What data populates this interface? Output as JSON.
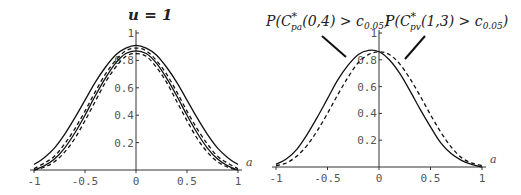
{
  "chart_data": [
    {
      "type": "line",
      "title": "u = 1",
      "xlabel": "a",
      "ylabel": "",
      "xlim": [
        -1,
        1
      ],
      "ylim": [
        0,
        1
      ],
      "x_ticks": [
        "-1",
        "-0.5",
        "0",
        "0.5",
        "1"
      ],
      "y_ticks": [
        "0.2",
        "0.4",
        "0.6",
        "0.8",
        "1"
      ],
      "grid": false,
      "x": [
        -1,
        -0.9,
        -0.8,
        -0.7,
        -0.6,
        -0.5,
        -0.4,
        -0.3,
        -0.2,
        -0.1,
        0,
        0.1,
        0.2,
        0.3,
        0.4,
        0.5,
        0.6,
        0.7,
        0.8,
        0.9,
        1
      ],
      "series": [
        {
          "name": "solid-outer",
          "style": "solid",
          "values": [
            0.04,
            0.09,
            0.16,
            0.26,
            0.38,
            0.51,
            0.64,
            0.75,
            0.84,
            0.89,
            0.91,
            0.89,
            0.84,
            0.75,
            0.64,
            0.51,
            0.38,
            0.26,
            0.16,
            0.09,
            0.04
          ]
        },
        {
          "name": "dashed-outer",
          "style": "dashed",
          "values": [
            0.01,
            0.05,
            0.1,
            0.19,
            0.3,
            0.43,
            0.57,
            0.7,
            0.8,
            0.87,
            0.89,
            0.87,
            0.8,
            0.7,
            0.57,
            0.43,
            0.3,
            0.19,
            0.1,
            0.05,
            0.01
          ]
        },
        {
          "name": "solid-inner",
          "style": "solid",
          "values": [
            0.0,
            0.03,
            0.08,
            0.16,
            0.27,
            0.4,
            0.54,
            0.67,
            0.78,
            0.85,
            0.87,
            0.85,
            0.78,
            0.67,
            0.54,
            0.4,
            0.27,
            0.16,
            0.08,
            0.03,
            0.0
          ]
        },
        {
          "name": "dashed-inner",
          "style": "dashed",
          "values": [
            0.0,
            0.02,
            0.06,
            0.13,
            0.23,
            0.36,
            0.5,
            0.64,
            0.75,
            0.83,
            0.85,
            0.83,
            0.75,
            0.64,
            0.5,
            0.36,
            0.23,
            0.13,
            0.06,
            0.02,
            0.0
          ]
        }
      ]
    },
    {
      "type": "line",
      "title": "",
      "xlabel": "a",
      "ylabel": "",
      "xlim": [
        -1,
        1
      ],
      "ylim": [
        0,
        1
      ],
      "x_ticks": [
        "-1",
        "-0.5",
        "0",
        "0.5",
        "1"
      ],
      "y_ticks": [
        "0.2",
        "0.4",
        "0.6",
        "0.8",
        "1"
      ],
      "grid": false,
      "annotations": [
        "P(C*pa(0,4) > c0.05)",
        "P(C*pv(1,3) > c0.05)"
      ],
      "x": [
        -1,
        -0.9,
        -0.8,
        -0.7,
        -0.6,
        -0.5,
        -0.4,
        -0.3,
        -0.2,
        -0.1,
        0,
        0.1,
        0.2,
        0.3,
        0.4,
        0.5,
        0.6,
        0.7,
        0.8,
        0.9,
        1
      ],
      "series": [
        {
          "name": "P(C*pa(0,4) > c0.05)",
          "style": "solid",
          "values": [
            0.02,
            0.06,
            0.13,
            0.24,
            0.37,
            0.51,
            0.65,
            0.76,
            0.84,
            0.87,
            0.86,
            0.8,
            0.7,
            0.57,
            0.43,
            0.3,
            0.18,
            0.1,
            0.05,
            0.02,
            0.0
          ]
        },
        {
          "name": "P(C*pv(1,3) > c0.05)",
          "style": "dashed",
          "values": [
            0.01,
            0.03,
            0.08,
            0.16,
            0.27,
            0.4,
            0.54,
            0.67,
            0.78,
            0.84,
            0.86,
            0.84,
            0.77,
            0.66,
            0.53,
            0.39,
            0.26,
            0.15,
            0.07,
            0.03,
            0.01
          ]
        }
      ]
    }
  ],
  "left": {
    "title": "u = 1",
    "x_axis_label": "a"
  },
  "right": {
    "label_pa": {
      "P": "P(C",
      "sup": "*",
      "sub": "pa",
      "rest": "(0,4) > c",
      "sub2": "0.05",
      "close": ")"
    },
    "label_pv": {
      "P": "P(C",
      "sup": "*",
      "sub": "pv",
      "rest": "(1,3) > c",
      "sub2": "0.05",
      "close": ")"
    },
    "x_axis_label": "a"
  }
}
